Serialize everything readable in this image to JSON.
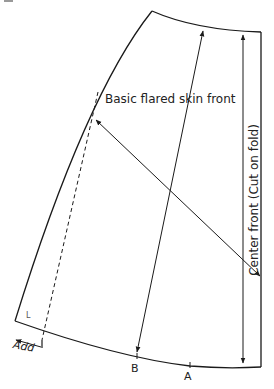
{
  "diagram": {
    "title": "Basic flared skin front",
    "center_label": "Center front (Cut on fold)",
    "points": [
      {
        "id": "B",
        "label": "B"
      },
      {
        "id": "A",
        "label": "A"
      }
    ],
    "add_label": "Add",
    "corner_label": "L",
    "colors": {
      "line": "#1a1a1a",
      "background": "#ffffff"
    }
  }
}
